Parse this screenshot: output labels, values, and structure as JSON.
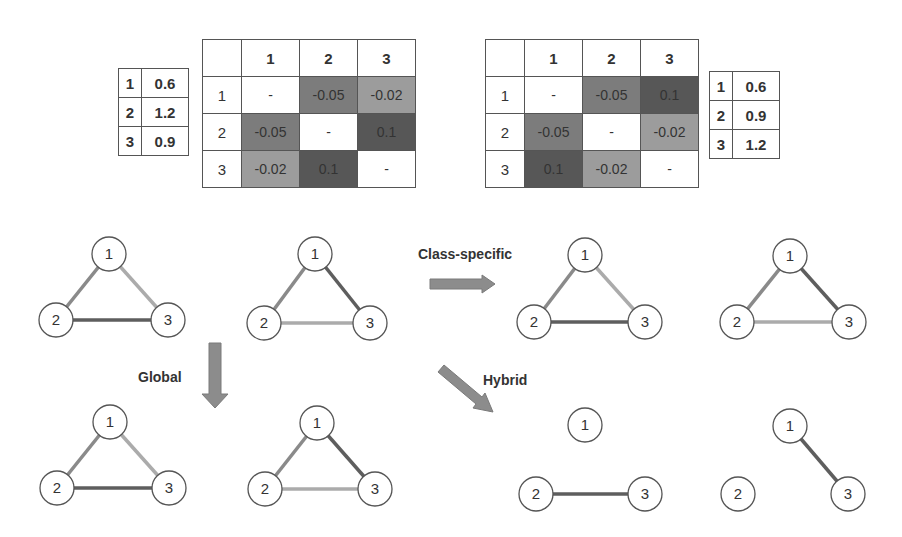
{
  "colors": {
    "cell_neg005": "#7c7c7c",
    "cell_neg002": "#9c9c9c",
    "cell_pos01": "#575757",
    "cell_diag": "#ffffff",
    "edge_dark": "#5e5e5e",
    "edge_medium": "#8a8a8a",
    "edge_light": "#ababab",
    "arrow": "#8c8c8c"
  },
  "left": {
    "weights": [
      {
        "node": "1",
        "value": "0.6"
      },
      {
        "node": "2",
        "value": "1.2"
      },
      {
        "node": "3",
        "value": "0.9"
      }
    ],
    "matrix": {
      "col_headers": [
        "1",
        "2",
        "3"
      ],
      "rows": [
        {
          "header": "1",
          "cells": [
            "-",
            "-0.05",
            "-0.02"
          ]
        },
        {
          "header": "2",
          "cells": [
            "-0.05",
            "-",
            "0.1"
          ]
        },
        {
          "header": "3",
          "cells": [
            "-0.02",
            "0.1",
            "-"
          ]
        }
      ]
    }
  },
  "right": {
    "weights": [
      {
        "node": "1",
        "value": "0.6"
      },
      {
        "node": "2",
        "value": "0.9"
      },
      {
        "node": "3",
        "value": "1.2"
      }
    ],
    "matrix": {
      "col_headers": [
        "1",
        "2",
        "3"
      ],
      "rows": [
        {
          "header": "1",
          "cells": [
            "-",
            "-0.05",
            "0.1"
          ]
        },
        {
          "header": "2",
          "cells": [
            "-0.05",
            "-",
            "-0.02"
          ]
        },
        {
          "header": "3",
          "cells": [
            "0.1",
            "-0.02",
            "-"
          ]
        }
      ]
    }
  },
  "operations": {
    "class_specific": "Class-specific",
    "global": "Global",
    "hybrid": "Hybrid"
  },
  "node_labels": [
    "1",
    "2",
    "3"
  ],
  "graphs": [
    {
      "id": "original-class-1",
      "edges": {
        "1-2": "medium",
        "1-3": "light",
        "2-3": "dark"
      }
    },
    {
      "id": "original-class-2",
      "edges": {
        "1-2": "medium",
        "1-3": "dark",
        "2-3": "light"
      }
    },
    {
      "id": "class-specific-1",
      "edges": {
        "1-2": "medium",
        "1-3": "light",
        "2-3": "dark"
      }
    },
    {
      "id": "class-specific-2",
      "edges": {
        "1-2": "medium",
        "1-3": "dark",
        "2-3": "light"
      }
    },
    {
      "id": "global-1",
      "edges": {
        "1-2": "medium",
        "1-3": "light",
        "2-3": "dark"
      }
    },
    {
      "id": "global-2",
      "edges": {
        "1-2": "medium",
        "1-3": "dark",
        "2-3": "light"
      }
    },
    {
      "id": "hybrid-1",
      "edges": {
        "2-3": "dark"
      }
    },
    {
      "id": "hybrid-2",
      "edges": {
        "1-3": "dark"
      }
    }
  ]
}
